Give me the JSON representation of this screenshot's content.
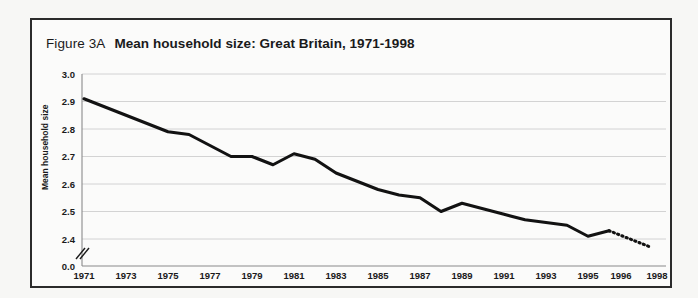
{
  "figure": {
    "number": "Figure 3A",
    "title": "Mean household size:  Great Britain, 1971-1998"
  },
  "chart_data": {
    "type": "line",
    "title": "Mean household size:  Great Britain, 1971-1998",
    "xlabel": "",
    "ylabel": "Mean household size",
    "ylim": [
      2.35,
      3.0
    ],
    "y_axis_break": true,
    "y_axis_break_symbol": "//",
    "grid": true,
    "legend": null,
    "ytick_labels": [
      "3.0",
      "2.9",
      "2.8",
      "2.7",
      "2.6",
      "2.5",
      "2.4",
      "0.0"
    ],
    "ytick_values": [
      3.0,
      2.9,
      2.8,
      2.7,
      2.6,
      2.5,
      2.4,
      0.0
    ],
    "xtick_labels": [
      "1971",
      "1973",
      "1975",
      "1977",
      "1979",
      "1981",
      "1983",
      "1985",
      "1987",
      "1989",
      "1991",
      "1993",
      "1995",
      "1996",
      "1998"
    ],
    "x": [
      1971,
      1972,
      1973,
      1974,
      1975,
      1976,
      1977,
      1978,
      1979,
      1980,
      1981,
      1982,
      1983,
      1984,
      1985,
      1986,
      1987,
      1988,
      1989,
      1990,
      1991,
      1992,
      1993,
      1994,
      1995,
      1996,
      1997,
      1998
    ],
    "values": [
      2.91,
      2.88,
      2.85,
      2.82,
      2.79,
      2.78,
      2.74,
      2.7,
      2.7,
      2.67,
      2.71,
      2.69,
      2.64,
      2.61,
      2.58,
      2.56,
      2.55,
      2.5,
      2.53,
      2.51,
      2.49,
      2.47,
      2.46,
      2.45,
      2.41,
      2.43,
      2.4,
      2.37
    ],
    "series": [
      {
        "name": "Mean household size",
        "style_solid_range": [
          1971,
          1996
        ],
        "style_dotted_range": [
          1996,
          1998
        ],
        "values": [
          2.91,
          2.88,
          2.85,
          2.82,
          2.79,
          2.78,
          2.74,
          2.7,
          2.7,
          2.67,
          2.71,
          2.69,
          2.64,
          2.61,
          2.58,
          2.56,
          2.55,
          2.5,
          2.53,
          2.51,
          2.49,
          2.47,
          2.46,
          2.45,
          2.41,
          2.43,
          2.4,
          2.37
        ]
      }
    ],
    "colors": {
      "line": "#121212",
      "grid": "#c9c9c9",
      "background": "#fbfbfa",
      "border": "#2b2b2b"
    }
  }
}
